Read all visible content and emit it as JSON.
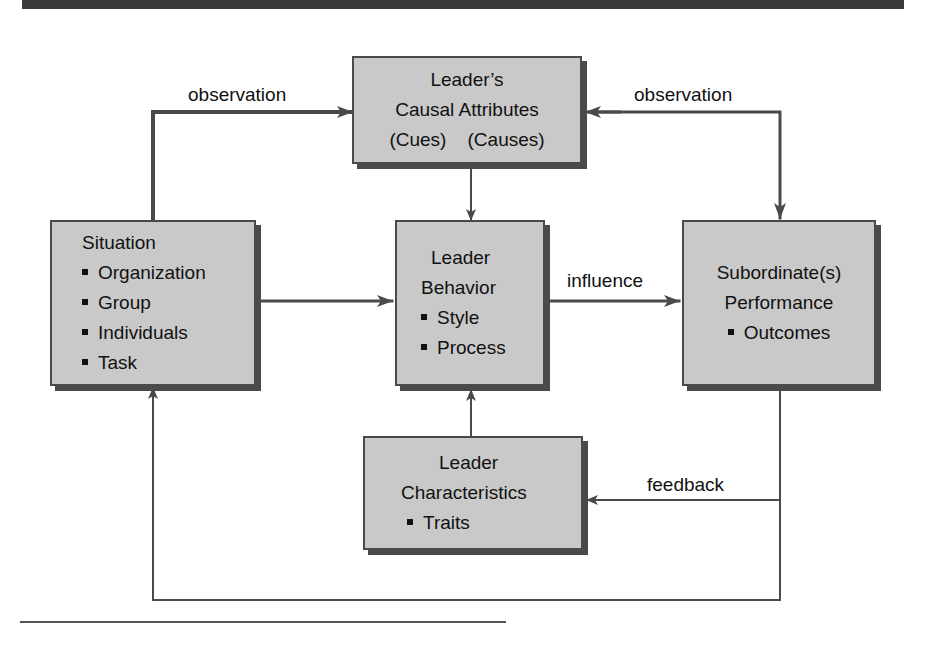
{
  "diagram": {
    "boxes": {
      "causal_attributes": {
        "lines": [
          "Leader’s",
          "Causal Attributes",
          "(Cues)    (Causes)"
        ]
      },
      "situation": {
        "title": "Situation",
        "items": [
          "Organization",
          "Group",
          "Individuals",
          "Task"
        ]
      },
      "leader_behavior": {
        "title_lines": [
          "Leader",
          "Behavior"
        ],
        "items": [
          "Style",
          "Process"
        ]
      },
      "subordinate_performance": {
        "title_lines": [
          "Subordinate(s)",
          "Performance"
        ],
        "items": [
          "Outcomes"
        ]
      },
      "leader_characteristics": {
        "title_lines": [
          "Leader",
          "Characteristics"
        ],
        "items": [
          "Traits"
        ]
      }
    },
    "edge_labels": {
      "observation_left": "observation",
      "observation_right": "observation",
      "influence": "influence",
      "feedback": "feedback"
    },
    "edges": [
      {
        "from": "situation",
        "to": "causal_attributes",
        "label": "observation"
      },
      {
        "from": "subordinate_performance",
        "to": "causal_attributes",
        "label": "observation",
        "bidirectional": true
      },
      {
        "from": "causal_attributes",
        "to": "leader_behavior"
      },
      {
        "from": "situation",
        "to": "leader_behavior"
      },
      {
        "from": "leader_behavior",
        "to": "subordinate_performance",
        "label": "influence"
      },
      {
        "from": "leader_characteristics",
        "to": "leader_behavior"
      },
      {
        "from": "subordinate_performance",
        "to": "leader_characteristics",
        "label": "feedback"
      },
      {
        "from": "subordinate_performance",
        "to": "situation"
      }
    ],
    "colors": {
      "box_fill": "#c9c9c9",
      "box_border": "#4a4a4a",
      "line": "#4a4a4a"
    }
  }
}
